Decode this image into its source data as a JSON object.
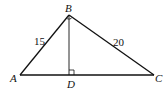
{
  "diagram": {
    "type": "geometry-triangle",
    "points": {
      "A": {
        "label": "A",
        "x": 20,
        "y": 75
      },
      "B": {
        "label": "B",
        "x": 69,
        "y": 15
      },
      "C": {
        "label": "C",
        "x": 154,
        "y": 75
      },
      "D": {
        "label": "D",
        "x": 69,
        "y": 75
      }
    },
    "sides": {
      "AB": {
        "label": "15"
      },
      "BC": {
        "label": "20"
      }
    },
    "right_angles": [
      "B",
      "D"
    ],
    "colors": {
      "stroke": "#111111",
      "background": "#ffffff"
    }
  }
}
